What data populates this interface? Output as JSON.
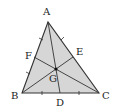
{
  "figure": {
    "fill_color": "#d6d6d6",
    "stroke_color": "#333333",
    "points": {
      "A": {
        "x": 48,
        "y": 22
      },
      "B": {
        "x": 22,
        "y": 93
      },
      "C": {
        "x": 99,
        "y": 93
      },
      "D": {
        "x": 60,
        "y": 93
      },
      "E": {
        "x": 73,
        "y": 57
      },
      "F": {
        "x": 34,
        "y": 57
      },
      "G": {
        "x": 56,
        "y": 69
      }
    },
    "labels": {
      "A": "A",
      "B": "B",
      "C": "C",
      "D": "D",
      "E": "E",
      "F": "F",
      "G": "G"
    }
  }
}
